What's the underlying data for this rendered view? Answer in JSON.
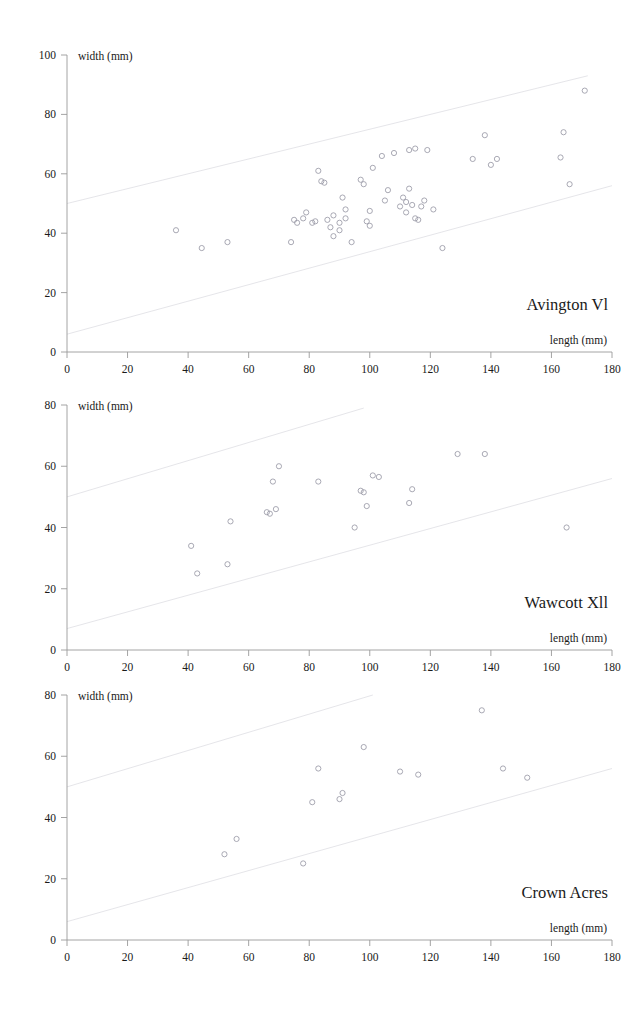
{
  "figure": {
    "axis_labels": {
      "x": "length (mm)",
      "y": "width (mm)"
    },
    "marker": "open-circle",
    "colors": {
      "axis": "#9a9a9a",
      "guide": "#e2e2e6",
      "marker": "#9a9aa6",
      "text": "#1a1a1a"
    }
  },
  "chart_data": [
    {
      "type": "scatter",
      "title": "Avington Vl",
      "xlabel": "length (mm)",
      "ylabel": "width (mm)",
      "xlim": [
        0,
        180
      ],
      "ylim": [
        0,
        100
      ],
      "xticks": [
        0,
        20,
        40,
        60,
        80,
        100,
        120,
        140,
        160,
        180
      ],
      "yticks": [
        0,
        20,
        40,
        60,
        80,
        100
      ],
      "grid": false,
      "legend": "none",
      "guide_lines": [
        {
          "name": "upper-envelope",
          "x": [
            0,
            172
          ],
          "y": [
            50,
            93
          ]
        },
        {
          "name": "lower-envelope",
          "x": [
            0,
            180
          ],
          "y": [
            6,
            56
          ]
        }
      ],
      "points": [
        [
          36,
          41
        ],
        [
          44.5,
          35
        ],
        [
          53,
          37
        ],
        [
          74,
          37
        ],
        [
          75,
          44.5
        ],
        [
          76,
          43.5
        ],
        [
          78,
          45
        ],
        [
          79,
          47
        ],
        [
          81,
          43.5
        ],
        [
          82,
          44
        ],
        [
          83,
          61
        ],
        [
          84,
          57.5
        ],
        [
          85,
          57
        ],
        [
          86,
          44.5
        ],
        [
          87,
          42
        ],
        [
          88,
          46
        ],
        [
          88,
          39
        ],
        [
          90,
          43.5
        ],
        [
          90,
          41
        ],
        [
          91,
          52
        ],
        [
          92,
          45
        ],
        [
          92,
          48
        ],
        [
          94,
          37
        ],
        [
          97,
          58
        ],
        [
          98,
          56.5
        ],
        [
          99,
          44
        ],
        [
          100,
          42.5
        ],
        [
          100,
          47.5
        ],
        [
          101,
          62
        ],
        [
          104,
          66
        ],
        [
          105,
          51
        ],
        [
          106,
          54.5
        ],
        [
          108,
          67
        ],
        [
          110,
          49
        ],
        [
          111,
          52
        ],
        [
          112,
          50.5
        ],
        [
          112,
          47
        ],
        [
          113,
          55
        ],
        [
          113,
          68
        ],
        [
          114,
          49.5
        ],
        [
          115,
          68.5
        ],
        [
          115,
          45
        ],
        [
          116,
          44.5
        ],
        [
          117,
          49
        ],
        [
          118,
          51
        ],
        [
          119,
          68
        ],
        [
          121,
          48
        ],
        [
          124,
          35
        ],
        [
          134,
          65
        ],
        [
          138,
          73
        ],
        [
          140,
          63
        ],
        [
          142,
          65
        ],
        [
          163,
          65.5
        ],
        [
          164,
          74
        ],
        [
          166,
          56.5
        ],
        [
          171,
          88
        ]
      ]
    },
    {
      "type": "scatter",
      "title": "Wawcott Xll",
      "xlabel": "length (mm)",
      "ylabel": "width (mm)",
      "xlim": [
        0,
        180
      ],
      "ylim": [
        0,
        80
      ],
      "xticks": [
        0,
        20,
        40,
        60,
        80,
        100,
        120,
        140,
        160,
        180
      ],
      "yticks": [
        0,
        20,
        40,
        60,
        80
      ],
      "grid": false,
      "legend": "none",
      "guide_lines": [
        {
          "name": "upper-envelope",
          "x": [
            0,
            98
          ],
          "y": [
            50,
            79
          ]
        },
        {
          "name": "lower-envelope",
          "x": [
            0,
            180
          ],
          "y": [
            7,
            56
          ]
        }
      ],
      "points": [
        [
          41,
          34
        ],
        [
          43,
          25
        ],
        [
          53,
          28
        ],
        [
          54,
          42
        ],
        [
          66,
          45
        ],
        [
          67,
          44.5
        ],
        [
          68,
          55
        ],
        [
          69,
          46
        ],
        [
          70,
          60
        ],
        [
          83,
          55
        ],
        [
          95,
          40
        ],
        [
          97,
          52
        ],
        [
          98,
          51.5
        ],
        [
          99,
          47
        ],
        [
          101,
          57
        ],
        [
          103,
          56.5
        ],
        [
          113,
          48
        ],
        [
          114,
          52.5
        ],
        [
          129,
          64
        ],
        [
          138,
          64
        ],
        [
          165,
          40
        ]
      ]
    },
    {
      "type": "scatter",
      "title": "Crown Acres",
      "xlabel": "length (mm)",
      "ylabel": "width (mm)",
      "xlim": [
        0,
        180
      ],
      "ylim": [
        0,
        80
      ],
      "xticks": [
        0,
        20,
        40,
        60,
        80,
        100,
        120,
        140,
        160,
        180
      ],
      "yticks": [
        0,
        20,
        40,
        60,
        80
      ],
      "grid": false,
      "legend": "none",
      "guide_lines": [
        {
          "name": "upper-envelope",
          "x": [
            0,
            101
          ],
          "y": [
            50,
            80
          ]
        },
        {
          "name": "lower-envelope",
          "x": [
            0,
            180
          ],
          "y": [
            6,
            56
          ]
        }
      ],
      "points": [
        [
          52,
          28
        ],
        [
          56,
          33
        ],
        [
          78,
          25
        ],
        [
          81,
          45
        ],
        [
          83,
          56
        ],
        [
          90,
          46
        ],
        [
          91,
          48
        ],
        [
          98,
          63
        ],
        [
          110,
          55
        ],
        [
          116,
          54
        ],
        [
          137,
          75
        ],
        [
          144,
          56
        ],
        [
          152,
          53
        ]
      ]
    }
  ]
}
